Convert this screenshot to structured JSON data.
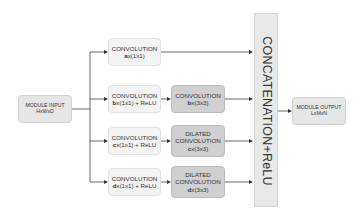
{
  "diagram": {
    "input": {
      "title": "MODULE INPUT",
      "dims": "HxWxD"
    },
    "output": {
      "title": "MODULE OUTPUT",
      "dims": "LxMxN"
    },
    "concat": {
      "label": "CONCATENATION+ReLU"
    },
    "branches": [
      {
        "stage1": {
          "title": "CONVOLUTION",
          "var": "a",
          "suffix": "x(1x1)"
        }
      },
      {
        "stage1": {
          "title": "CONVOLUTION",
          "var": "b",
          "suffix": "x(1x1) + ReLU"
        },
        "stage2": {
          "title": "CONVOLUTION",
          "var": "b",
          "suffix": "x(3x3)"
        }
      },
      {
        "stage1": {
          "title": "CONVOLUTION",
          "var": "c",
          "suffix": "x(1x1) + ReLU"
        },
        "stage2": {
          "title_line1": "DILATED",
          "title": "CONVOLUTION",
          "var": "c",
          "suffix": "x(3x3)"
        }
      },
      {
        "stage1": {
          "title": "CONVOLUTION",
          "var": "d",
          "suffix": "x(1x1) + ReLU"
        },
        "stage2": {
          "title_line1": "DILATED",
          "title": "CONVOLUTION",
          "var": "d",
          "suffix": "x(3x3)"
        }
      }
    ]
  }
}
